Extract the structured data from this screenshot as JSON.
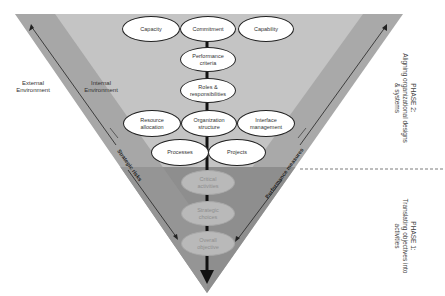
{
  "environment": {
    "external_label": "External\nEnvironment",
    "internal_label": "Internal\nEnvironment"
  },
  "upper_section": {
    "top_row": [
      "Capacity",
      "Commitment",
      "Capability"
    ],
    "center_column": [
      "Performance criteria",
      "Roles & responsibilities"
    ],
    "middle_row": [
      "Resource allocation",
      "Organization structure",
      "Interface management"
    ],
    "lower_row": [
      "Processes",
      "Projects"
    ]
  },
  "lower_section": {
    "items": [
      "Critical activities",
      "Strategic choices",
      "Overall objective"
    ]
  },
  "side_arrows": {
    "left": "Strategic risks",
    "right": "Performance measures"
  },
  "phases": {
    "phase2_title": "PHASE 2:",
    "phase2_desc": "Aligning organizational designs & systems",
    "phase1_title": "PHASE 1:",
    "phase1_desc": "Translating objectives into activities"
  },
  "colors": {
    "upper_fill": "#c2c2c2",
    "lower_fill": "#8f8f8f",
    "edge_band": "#a9a9a9",
    "spine": "#111111"
  }
}
